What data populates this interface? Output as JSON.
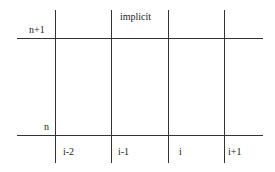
{
  "diagram": {
    "type": "stencil-grid",
    "row_labels": {
      "top": "n+1",
      "bottom": "n"
    },
    "header_label": "implicit",
    "column_labels": [
      "i-2",
      "i-1",
      "i",
      "i+1"
    ],
    "grid": {
      "vertical_lines_x": [
        55,
        111,
        168,
        224
      ],
      "vertical_extent_y": [
        10,
        163
      ],
      "horizontal_lines_y": [
        38,
        135
      ],
      "horizontal_extent_x": [
        17,
        263
      ]
    },
    "colors": {
      "line": "#333333",
      "text": "#222222",
      "background": "#ffffff"
    }
  }
}
